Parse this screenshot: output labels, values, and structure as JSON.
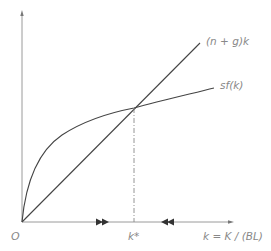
{
  "diagram": {
    "colors": {
      "axis": "#9a9a9a",
      "curve": "#444444",
      "label": "#888888",
      "arrow": "#333333"
    },
    "labels": {
      "origin": "O",
      "line_label": "(n + g)k",
      "curve_label": "sf(k)",
      "steady_state": "k*",
      "x_axis": "k = K / (BL)"
    },
    "arrows": {
      "left_of_steady_state": "rightward",
      "right_of_steady_state": "leftward"
    }
  }
}
